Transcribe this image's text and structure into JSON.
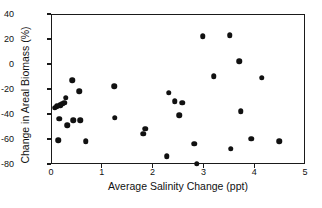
{
  "chart_data": {
    "type": "scatter",
    "title": "",
    "xlabel": "Average Salinity Change (ppt)",
    "ylabel": "Change in Areal Biomass (%)",
    "xlim": [
      0,
      5
    ],
    "ylim": [
      -80,
      40
    ],
    "xticks": [
      0,
      1,
      2,
      3,
      4,
      5
    ],
    "yticks": [
      40,
      20,
      0,
      -20,
      -40,
      -60,
      -80
    ],
    "xtick_labels": [
      "0",
      "1",
      "2",
      "3",
      "4",
      "5"
    ],
    "ytick_labels": [
      "40",
      "20",
      "0",
      "-20",
      "-40",
      "-60",
      "-80"
    ],
    "grid": false,
    "legend": false,
    "marker": "filled-circle",
    "marker_color": "#111111",
    "points": [
      {
        "x": 0.05,
        "y": -34
      },
      {
        "x": 0.09,
        "y": -33
      },
      {
        "x": 0.12,
        "y": -60
      },
      {
        "x": 0.14,
        "y": -43
      },
      {
        "x": 0.16,
        "y": -32
      },
      {
        "x": 0.2,
        "y": -31
      },
      {
        "x": 0.24,
        "y": -30
      },
      {
        "x": 0.27,
        "y": -26
      },
      {
        "x": 0.3,
        "y": -48
      },
      {
        "x": 0.4,
        "y": -12
      },
      {
        "x": 0.42,
        "y": -44
      },
      {
        "x": 0.54,
        "y": -21
      },
      {
        "x": 0.56,
        "y": -44
      },
      {
        "x": 0.66,
        "y": -61
      },
      {
        "x": 1.23,
        "y": -17
      },
      {
        "x": 1.24,
        "y": -42
      },
      {
        "x": 1.8,
        "y": -55
      },
      {
        "x": 1.84,
        "y": -51
      },
      {
        "x": 2.26,
        "y": -73
      },
      {
        "x": 2.3,
        "y": -22
      },
      {
        "x": 2.42,
        "y": -29
      },
      {
        "x": 2.5,
        "y": -40
      },
      {
        "x": 2.56,
        "y": -30
      },
      {
        "x": 2.8,
        "y": -63
      },
      {
        "x": 2.85,
        "y": -79
      },
      {
        "x": 2.97,
        "y": 23
      },
      {
        "x": 3.18,
        "y": -9
      },
      {
        "x": 3.5,
        "y": 24
      },
      {
        "x": 3.52,
        "y": -67
      },
      {
        "x": 3.69,
        "y": 3
      },
      {
        "x": 3.72,
        "y": -37
      },
      {
        "x": 3.92,
        "y": -59
      },
      {
        "x": 4.13,
        "y": -10
      },
      {
        "x": 4.47,
        "y": -61
      }
    ]
  }
}
